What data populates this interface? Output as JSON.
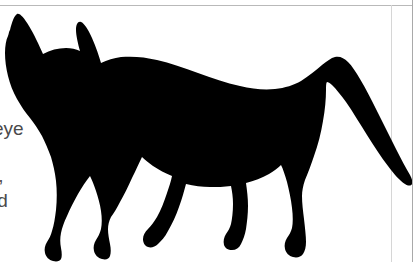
{
  "page": {
    "background_color": "#ffffff",
    "width": 418,
    "height": 262,
    "border_color_outer": "#a9a9a9",
    "border_color_inner": "#d6d6d6",
    "border_color_top": "#b9b9b9"
  },
  "text_fragments": {
    "line1": "eye",
    "line2": "t,",
    "line3": "ld",
    "text_color": "#4a4a4a"
  },
  "artwork": {
    "name": "cat-silhouette",
    "fill_color": "#000000",
    "description": "Black silhouette of a walking cat seen from the side, head turned toward viewer, long tail curving down to the lower right"
  }
}
